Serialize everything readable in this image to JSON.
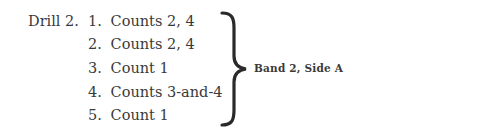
{
  "drill": {
    "label": "Drill 2.",
    "items": [
      {
        "num": "1.",
        "text": "Counts 2, 4"
      },
      {
        "num": "2.",
        "text": "Counts 2, 4"
      },
      {
        "num": "3.",
        "text": "Count 1"
      },
      {
        "num": "4.",
        "text": "Counts 3-and-4"
      },
      {
        "num": "5.",
        "text": "Count 1"
      }
    ],
    "band_label": "Band 2, Side A"
  }
}
